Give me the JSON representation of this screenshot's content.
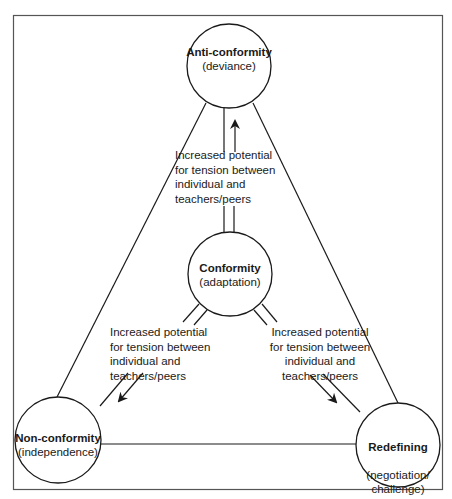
{
  "diagram": {
    "type": "triangle-relationship",
    "colors": {
      "line": "#1a1a1a",
      "frame": "#555555",
      "background": "#ffffff"
    },
    "nodes": {
      "top": {
        "title": "Anti-conformity",
        "subtitle": "(deviance)"
      },
      "center": {
        "title": "Conformity",
        "subtitle": "(adaptation)"
      },
      "bottom_left": {
        "title": "Non-conformity",
        "subtitle": "(independence)"
      },
      "bottom_right": {
        "title": "Redefining",
        "subtitle": "(negotiation/\nchallenge)"
      }
    },
    "annotations": {
      "up": "Increased potential\nfor tension between\nindividual and\nteachers/peers",
      "down_left": "Increased potential\nfor tension between\nindividual and\nteachers/peers",
      "down_right": "Increased potential\nfor tension between\nindividual and\nteachers/peers"
    },
    "edges": [
      {
        "from": "top",
        "to": "bottom_left"
      },
      {
        "from": "top",
        "to": "bottom_right"
      },
      {
        "from": "bottom_left",
        "to": "bottom_right"
      },
      {
        "from": "center",
        "to": "top",
        "arrow": true
      },
      {
        "from": "center",
        "to": "bottom_left",
        "arrow": true
      },
      {
        "from": "center",
        "to": "bottom_right",
        "arrow": true
      }
    ]
  }
}
